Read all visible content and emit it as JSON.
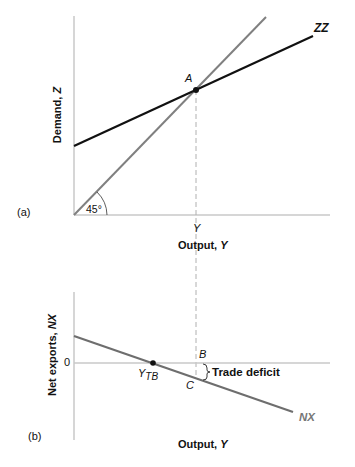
{
  "panel_a": {
    "tag": "(a)",
    "ylabel_text": "Demand, ",
    "ylabel_var": "Z",
    "xlabel_text": "Output, ",
    "xlabel_var": "Y",
    "point_label": "A",
    "tick_label_y": "Y",
    "angle_label": "45°",
    "curve_label": "ZZ"
  },
  "panel_b": {
    "tag": "(b)",
    "ylabel_text": "Net exports, ",
    "ylabel_var": "NX",
    "xlabel_text": "Output, ",
    "xlabel_var": "Y",
    "zero_label": "0",
    "point_b": "B",
    "point_c": "C",
    "ytb_main": "Y",
    "ytb_sub": "TB",
    "annotation": "Trade deficit",
    "curve_label": "NX"
  },
  "colors": {
    "axis": "#c8c8c8",
    "zz_line": "#111111",
    "line_45": "#808080",
    "nx_line": "#6e6e6e",
    "dashed": "#b0b0b0",
    "text": "#111111",
    "nx_label": "#777777"
  }
}
